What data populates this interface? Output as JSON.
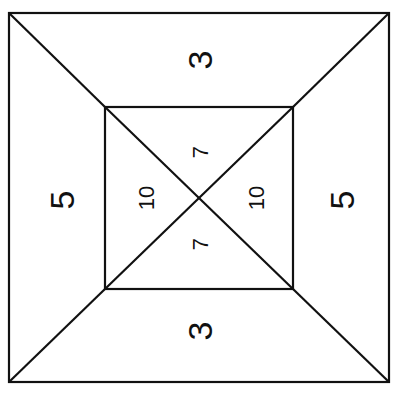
{
  "diagram": {
    "stroke_color": "#111111",
    "background": "#ffffff",
    "outer_square": {
      "x1": 9,
      "y1": 13,
      "x2": 389,
      "y2": 382
    },
    "inner_square": {
      "x1": 105,
      "y1": 107,
      "x2": 293,
      "y2": 289
    },
    "labels": {
      "top": "3",
      "bottom": "3",
      "left": "5",
      "right": "5",
      "inner_top": "7",
      "inner_bottom": "7",
      "inner_left": "10",
      "inner_right": "10"
    }
  }
}
